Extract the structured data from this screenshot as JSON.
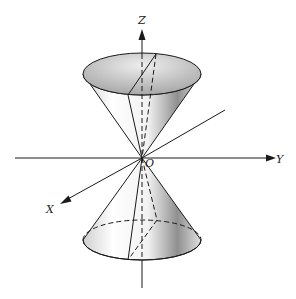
{
  "diagram": {
    "labels": {
      "z_axis": "Z",
      "y_axis": "Y",
      "x_axis": "X",
      "origin": "O"
    },
    "colors": {
      "stroke": "#1a1a1a",
      "shade_dark": "#9a9a9a",
      "shade_light": "#ffffff"
    }
  }
}
